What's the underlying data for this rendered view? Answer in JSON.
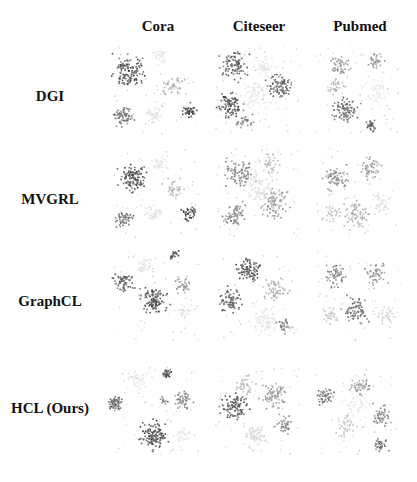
{
  "figure": {
    "columns": [
      "Cora",
      "Citeseer",
      "Pubmed"
    ],
    "rows": [
      "DGI",
      "MVGRL",
      "GraphCL",
      "HCL (Ours)"
    ]
  },
  "plots": [
    [
      {
        "clusters": [
          [
            25,
            30,
            14,
            0.85,
            120
          ],
          [
            70,
            45,
            10,
            0.4,
            40
          ],
          [
            20,
            75,
            9,
            0.7,
            60
          ],
          [
            85,
            70,
            7,
            0.9,
            40
          ],
          [
            50,
            75,
            8,
            0.15,
            40
          ],
          [
            55,
            15,
            8,
            0.12,
            30
          ]
        ]
      },
      {
        "clusters": [
          [
            30,
            25,
            13,
            0.8,
            90
          ],
          [
            75,
            45,
            13,
            0.75,
            90
          ],
          [
            25,
            65,
            12,
            0.85,
            90
          ],
          [
            50,
            55,
            14,
            0.12,
            70
          ],
          [
            40,
            80,
            8,
            0.6,
            30
          ],
          [
            60,
            25,
            10,
            0.15,
            40
          ]
        ]
      },
      {
        "clusters": [
          [
            35,
            25,
            10,
            0.5,
            50
          ],
          [
            70,
            20,
            8,
            0.5,
            40
          ],
          [
            40,
            70,
            12,
            0.75,
            90
          ],
          [
            65,
            85,
            6,
            0.8,
            30
          ],
          [
            70,
            50,
            14,
            0.1,
            70
          ],
          [
            30,
            45,
            8,
            0.4,
            30
          ]
        ]
      }
    ],
    [
      {
        "clusters": [
          [
            30,
            35,
            13,
            0.85,
            120
          ],
          [
            20,
            75,
            8,
            0.7,
            50
          ],
          [
            85,
            70,
            7,
            0.9,
            40
          ],
          [
            70,
            45,
            10,
            0.35,
            40
          ],
          [
            55,
            20,
            8,
            0.15,
            30
          ],
          [
            50,
            70,
            8,
            0.15,
            40
          ]
        ]
      },
      {
        "clusters": [
          [
            35,
            30,
            14,
            0.6,
            90
          ],
          [
            70,
            60,
            14,
            0.5,
            90
          ],
          [
            30,
            70,
            12,
            0.6,
            70
          ],
          [
            55,
            45,
            16,
            0.15,
            80
          ],
          [
            65,
            20,
            10,
            0.35,
            40
          ]
        ]
      },
      {
        "clusters": [
          [
            30,
            35,
            12,
            0.55,
            70
          ],
          [
            65,
            25,
            10,
            0.5,
            50
          ],
          [
            50,
            70,
            13,
            0.4,
            70
          ],
          [
            75,
            60,
            10,
            0.15,
            50
          ],
          [
            25,
            70,
            8,
            0.3,
            30
          ]
        ]
      }
    ],
    [
      {
        "clusters": [
          [
            20,
            35,
            9,
            0.8,
            60
          ],
          [
            50,
            55,
            13,
            0.85,
            110
          ],
          [
            70,
            10,
            5,
            0.9,
            20
          ],
          [
            80,
            40,
            8,
            0.5,
            40
          ],
          [
            40,
            20,
            9,
            0.15,
            40
          ],
          [
            80,
            65,
            7,
            0.15,
            30
          ]
        ]
      },
      {
        "clusters": [
          [
            45,
            25,
            12,
            0.85,
            90
          ],
          [
            25,
            55,
            12,
            0.75,
            80
          ],
          [
            70,
            45,
            12,
            0.4,
            60
          ],
          [
            60,
            75,
            12,
            0.15,
            60
          ],
          [
            80,
            80,
            7,
            0.6,
            30
          ]
        ]
      },
      {
        "clusters": [
          [
            30,
            30,
            11,
            0.6,
            60
          ],
          [
            70,
            30,
            10,
            0.55,
            50
          ],
          [
            50,
            65,
            13,
            0.7,
            80
          ],
          [
            80,
            70,
            9,
            0.2,
            40
          ],
          [
            25,
            70,
            8,
            0.3,
            30
          ]
        ]
      }
    ],
    [
      {
        "clusters": [
          [
            12,
            42,
            7,
            0.75,
            70
          ],
          [
            50,
            75,
            13,
            0.9,
            120
          ],
          [
            62,
            12,
            5,
            0.85,
            30
          ],
          [
            80,
            40,
            9,
            0.6,
            50
          ],
          [
            35,
            20,
            8,
            0.15,
            30
          ],
          [
            80,
            75,
            7,
            0.12,
            30
          ],
          [
            60,
            40,
            4,
            0.7,
            10
          ]
        ]
      },
      {
        "clusters": [
          [
            30,
            45,
            13,
            0.85,
            100
          ],
          [
            70,
            35,
            12,
            0.5,
            80
          ],
          [
            50,
            75,
            12,
            0.2,
            70
          ],
          [
            40,
            25,
            10,
            0.35,
            40
          ],
          [
            80,
            65,
            9,
            0.6,
            40
          ]
        ]
      },
      {
        "clusters": [
          [
            20,
            35,
            9,
            0.65,
            50
          ],
          [
            55,
            25,
            10,
            0.5,
            50
          ],
          [
            75,
            55,
            10,
            0.6,
            50
          ],
          [
            40,
            65,
            10,
            0.3,
            40
          ],
          [
            75,
            85,
            7,
            0.75,
            30
          ],
          [
            50,
            45,
            12,
            0.12,
            40
          ]
        ]
      }
    ]
  ]
}
